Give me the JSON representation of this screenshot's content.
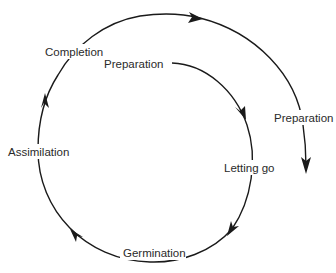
{
  "diagram": {
    "type": "cycle-spiral",
    "direction": "clockwise",
    "stroke_color": "#1a1a1a",
    "text_color": "#2a2a2a",
    "background": "#ffffff",
    "labels": {
      "preparation_inner": "Preparation",
      "letting_go": "Letting go",
      "germination": "Germination",
      "assimilation": "Assimilation",
      "completion": "Completion",
      "preparation_outer": "Preparation"
    },
    "stages": [
      {
        "label": "Preparation",
        "position": "inner start"
      },
      {
        "label": "Letting go",
        "position": "right"
      },
      {
        "label": "Germination",
        "position": "bottom"
      },
      {
        "label": "Assimilation",
        "position": "left"
      },
      {
        "label": "Completion",
        "position": "top-left"
      },
      {
        "label": "Preparation",
        "position": "outer continuation"
      }
    ]
  }
}
